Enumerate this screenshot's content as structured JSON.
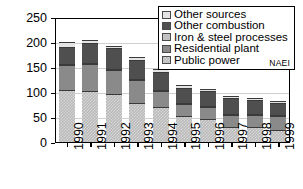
{
  "chart_data": {
    "type": "bar",
    "stacked": true,
    "title": "",
    "xlabel": "",
    "ylabel": "Emissions (t)",
    "ylim": [
      0,
      250
    ],
    "yticks": [
      0,
      50,
      100,
      150,
      200,
      250
    ],
    "grid": true,
    "legend_position": "top-right",
    "annotation": "NAEI",
    "categories": [
      "1990",
      "1991",
      "1992",
      "1993",
      "1994",
      "1995",
      "1996",
      "1997",
      "1998",
      "1999"
    ],
    "series": [
      {
        "name": "Public power",
        "color": "#c8c8c8",
        "pattern": "checkered",
        "values": [
          107,
          105,
          99,
          81,
          72,
          55,
          49,
          32,
          33,
          26
        ]
      },
      {
        "name": "Residential plant",
        "color": "#8a8a8a",
        "pattern": "solid",
        "values": [
          50,
          53,
          47,
          46,
          33,
          23,
          23,
          25,
          24,
          28
        ]
      },
      {
        "name": "Iron & steel processes",
        "color": "#c2c2c2",
        "pattern": "solid",
        "values": [
          2,
          2,
          2,
          2,
          2,
          2,
          2,
          2,
          2,
          2
        ]
      },
      {
        "name": "Other combustion",
        "color": "#4f4f4f",
        "pattern": "solid",
        "values": [
          34,
          40,
          42,
          38,
          35,
          31,
          30,
          31,
          27,
          24
        ]
      },
      {
        "name": "Other sources",
        "color": "#e4e4e4",
        "pattern": "solid",
        "values": [
          10,
          6,
          5,
          5,
          6,
          5,
          4,
          4,
          4,
          5
        ]
      }
    ],
    "totals": [
      203,
      206,
      195,
      172,
      148,
      116,
      108,
      94,
      90,
      85
    ]
  },
  "legend": {
    "items": [
      {
        "label": "Other sources"
      },
      {
        "label": "Other combustion"
      },
      {
        "label": "Iron & steel processes"
      },
      {
        "label": "Residential plant"
      },
      {
        "label": "Public power"
      }
    ],
    "source_note": "NAEI"
  }
}
